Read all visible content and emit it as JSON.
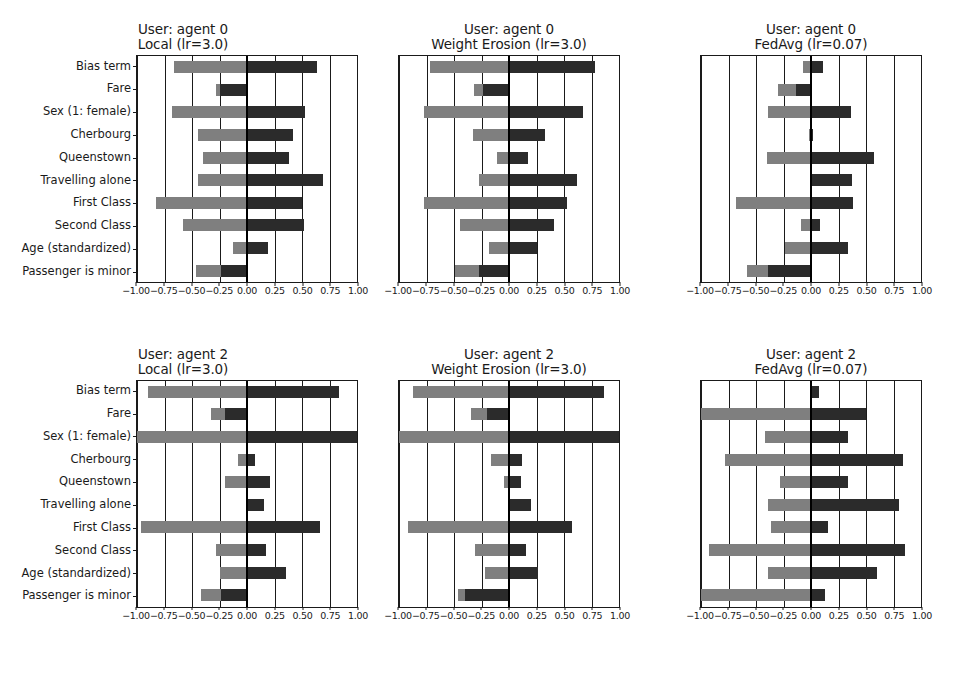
{
  "figure": {
    "background": "#ffffff",
    "neg_color": "#7f7f7f",
    "pos_color": "#2b2b2b"
  },
  "chart_data": {
    "type": "bar",
    "orientation": "horizontal",
    "title": "",
    "xlabel": "",
    "ylabel": "",
    "xlim": [
      -1.0,
      1.0
    ],
    "grid": true,
    "legend": "none",
    "xticks": [
      -1.0,
      -0.75,
      -0.5,
      -0.25,
      0.0,
      0.25,
      0.5,
      0.75,
      1.0
    ],
    "xticklabels": [
      "−1.00",
      "−0.75",
      "−0.50",
      "−0.25",
      "0.00",
      "0.25",
      "0.50",
      "0.75",
      "1.00"
    ],
    "categories": [
      "Bias term",
      "Fare",
      "Sex (1: female)",
      "Cherbourg",
      "Queenstown",
      "Travelling alone",
      "First Class",
      "Second Class",
      "Age (standardized)",
      "Passenger is minor"
    ],
    "series_names": [
      "negative",
      "positive"
    ],
    "panels": [
      {
        "id": "agent0-local",
        "title_line1": "User: agent 0",
        "title_line2": "Local (lr=3.0)",
        "user": "agent 0",
        "method": "Local",
        "lr": "3.0",
        "row": 0,
        "col": 0,
        "negative": [
          -0.66,
          -0.28,
          -0.68,
          -0.45,
          -0.4,
          -0.45,
          -0.83,
          -0.58,
          -0.13,
          -0.46
        ],
        "positive": [
          0.64,
          -0.25,
          0.53,
          0.42,
          0.38,
          0.69,
          0.5,
          0.52,
          0.19,
          -0.24
        ]
      },
      {
        "id": "agent0-weighterosion",
        "title_line1": "User: agent 0",
        "title_line2": "Weight Erosion (lr=3.0)",
        "user": "agent 0",
        "method": "Weight Erosion",
        "lr": "3.0",
        "row": 0,
        "col": 1,
        "negative": [
          -0.72,
          -0.32,
          -0.77,
          -0.33,
          -0.11,
          -0.27,
          -0.77,
          -0.45,
          -0.18,
          -0.49
        ],
        "positive": [
          0.78,
          -0.24,
          0.67,
          0.33,
          0.17,
          0.62,
          0.53,
          0.41,
          0.25,
          -0.27
        ]
      },
      {
        "id": "agent0-fedavg",
        "title_line1": "User: agent 0",
        "title_line2": "FedAvg (lr=0.07)",
        "user": "agent 0",
        "method": "FedAvg",
        "lr": "0.07",
        "row": 0,
        "col": 2,
        "negative": [
          -0.07,
          -0.3,
          -0.39,
          -0.02,
          -0.4,
          0.0,
          -0.68,
          -0.09,
          -0.24,
          -0.58
        ],
        "positive": [
          0.11,
          -0.14,
          0.36,
          0.02,
          0.57,
          0.37,
          0.38,
          0.08,
          0.34,
          -0.39
        ]
      },
      {
        "id": "agent2-local",
        "title_line1": "User: agent 2",
        "title_line2": "Local (lr=3.0)",
        "user": "agent 2",
        "method": "Local",
        "lr": "3.0",
        "row": 1,
        "col": 0,
        "negative": [
          -0.9,
          -0.33,
          -1.0,
          -0.08,
          -0.2,
          0.0,
          -0.96,
          -0.28,
          -0.25,
          -0.42
        ],
        "positive": [
          0.84,
          -0.2,
          1.0,
          0.07,
          0.21,
          0.15,
          0.66,
          0.17,
          0.35,
          -0.24
        ]
      },
      {
        "id": "agent2-weighterosion",
        "title_line1": "User: agent 2",
        "title_line2": "Weight Erosion (lr=3.0)",
        "user": "agent 2",
        "method": "Weight Erosion",
        "lr": "3.0",
        "row": 1,
        "col": 1,
        "negative": [
          -0.87,
          -0.35,
          -1.0,
          -0.16,
          -0.05,
          0.0,
          -0.92,
          -0.31,
          -0.22,
          -0.46
        ],
        "positive": [
          0.86,
          -0.2,
          1.0,
          0.12,
          0.11,
          0.2,
          0.57,
          0.15,
          0.26,
          -0.4
        ]
      },
      {
        "id": "agent2-fedavg",
        "title_line1": "User: agent 2",
        "title_line2": "FedAvg (lr=0.07)",
        "user": "agent 2",
        "method": "FedAvg",
        "lr": "0.07",
        "row": 1,
        "col": 2,
        "negative": [
          0.0,
          -1.0,
          -0.42,
          -0.78,
          -0.28,
          -0.39,
          -0.36,
          -0.93,
          -0.39,
          -1.0
        ],
        "positive": [
          0.07,
          0.5,
          0.34,
          0.84,
          0.34,
          0.8,
          0.15,
          0.85,
          0.6,
          0.13
        ]
      }
    ]
  }
}
